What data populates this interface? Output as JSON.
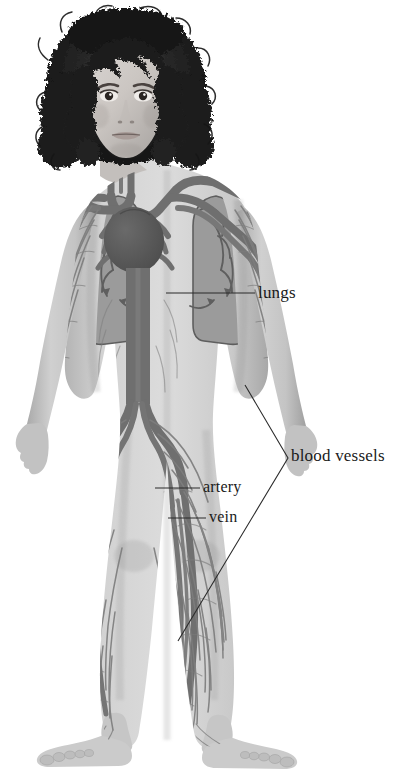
{
  "diagram": {
    "background_color": "#ffffff",
    "figure_description": "Front view of a child with curly dark hair, showing the circulatory system: heart, lungs, arteries and veins throughout the body",
    "labels": [
      {
        "id": "lungs",
        "text": "lungs",
        "leader": "straight-horizontal-line"
      },
      {
        "id": "artery",
        "text": "artery",
        "leader": "straight-horizontal-line"
      },
      {
        "id": "vein",
        "text": "vein",
        "leader": "straight-horizontal-line"
      },
      {
        "id": "blood_vessels",
        "text": "blood vessels",
        "leader": "v-shaped-bracket"
      }
    ],
    "colors": {
      "skin_light": "#d4d4d4",
      "skin_mid": "#bdbdbd",
      "skin_shadow": "#a2a2a2",
      "hair_dark": "#1c1c1c",
      "vessel": "#6f6f6f",
      "vessel_dark": "#5a5a5a",
      "vessel_fine": "#8a8a8a",
      "heart": "#585858",
      "lung_fill": "#9a9a9a",
      "lung_outline": "#5e5e5e",
      "label_text": "#1a1a1a",
      "leader_line": "#2b2b2b"
    }
  }
}
